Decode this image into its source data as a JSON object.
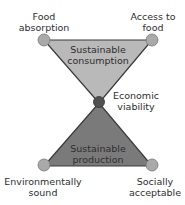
{
  "colors": {
    "top_triangle_fill": "#b9b9b9",
    "bottom_triangle_fill": "#7a7a7a",
    "outline": "#3a3a3a",
    "corner_node_fill": "#a9a9a9",
    "center_node_fill": "#505050",
    "text": "#2e2e2e"
  },
  "top_triangle": {
    "label_line1": "Sustainable",
    "label_line2": "consumption"
  },
  "bottom_triangle": {
    "label_line1": "Sustainable",
    "label_line2": "production"
  },
  "nodes": {
    "top_left": {
      "line1": "Food",
      "line2": "absorption"
    },
    "top_right": {
      "line1": "Access to",
      "line2": "food"
    },
    "center": {
      "line1": "Economic",
      "line2": "viability"
    },
    "bottom_left": {
      "line1": "Environmentally",
      "line2": "sound"
    },
    "bottom_right": {
      "line1": "Socially",
      "line2": "acceptable"
    }
  }
}
